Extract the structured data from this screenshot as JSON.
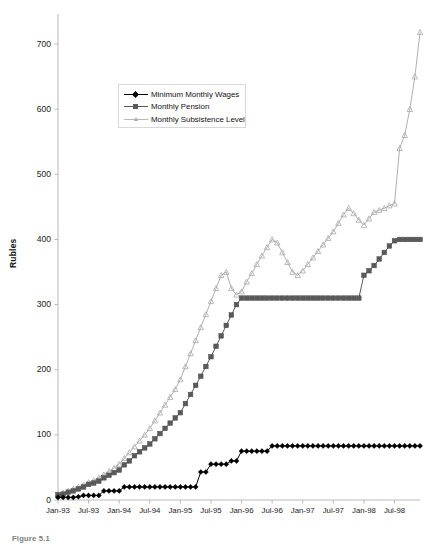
{
  "figure": {
    "caption": "Figure 5.1",
    "ylabel": "Rubles",
    "xlabel": ""
  },
  "legend": {
    "position": "inside-top-left",
    "items": [
      {
        "label": "Minimum Monthly Wages",
        "color": "#000000",
        "marker": "diamond"
      },
      {
        "label": "Monthly Pension",
        "color": "#5a5a5a",
        "marker": "square"
      },
      {
        "label": "Monthly Subsistence Level",
        "color": "#a8a8a8",
        "marker": "triangle"
      }
    ]
  },
  "chart_data": {
    "type": "line",
    "title": "",
    "xlabel": "",
    "ylabel": "Rubles",
    "ylim": [
      0,
      740
    ],
    "yticks": [
      0,
      100,
      200,
      300,
      400,
      500,
      600,
      700
    ],
    "ytick_labels": [
      "0",
      "100",
      "200",
      "300",
      "400",
      "500",
      "600",
      "700"
    ],
    "grid": false,
    "xticks": [
      "Jan-93",
      "Jul-93",
      "Jan-94",
      "Jul-94",
      "Jan-95",
      "Jul-95",
      "Jan-96",
      "Jul-96",
      "Jan-97",
      "Jul-97",
      "Jan-98",
      "Jul-98"
    ],
    "x": [
      "Jan-93",
      "Feb-93",
      "Mar-93",
      "Apr-93",
      "May-93",
      "Jun-93",
      "Jul-93",
      "Aug-93",
      "Sep-93",
      "Oct-93",
      "Nov-93",
      "Dec-93",
      "Jan-94",
      "Feb-94",
      "Mar-94",
      "Apr-94",
      "May-94",
      "Jun-94",
      "Jul-94",
      "Aug-94",
      "Sep-94",
      "Oct-94",
      "Nov-94",
      "Dec-94",
      "Jan-95",
      "Feb-95",
      "Mar-95",
      "Apr-95",
      "May-95",
      "Jun-95",
      "Jul-95",
      "Aug-95",
      "Sep-95",
      "Oct-95",
      "Nov-95",
      "Dec-95",
      "Jan-96",
      "Feb-96",
      "Mar-96",
      "Apr-96",
      "May-96",
      "Jun-96",
      "Jul-96",
      "Aug-96",
      "Sep-96",
      "Oct-96",
      "Nov-96",
      "Dec-96",
      "Jan-97",
      "Feb-97",
      "Mar-97",
      "Apr-97",
      "May-97",
      "Jun-97",
      "Jul-97",
      "Aug-97",
      "Sep-97",
      "Oct-97",
      "Nov-97",
      "Dec-97",
      "Jan-98",
      "Feb-98",
      "Mar-98",
      "Apr-98",
      "May-98",
      "Jun-98",
      "Jul-98",
      "Aug-98",
      "Sep-98",
      "Oct-98",
      "Nov-98",
      "Dec-98"
    ],
    "series": [
      {
        "name": "Minimum Monthly Wages",
        "color": "#000000",
        "marker": "diamond",
        "values": [
          4,
          4,
          4,
          4,
          5,
          7,
          7,
          7,
          7,
          14,
          14,
          14,
          14,
          20,
          20,
          20,
          20,
          20,
          20,
          20,
          20,
          20,
          20,
          20,
          20,
          20,
          20,
          20,
          43,
          43,
          55,
          55,
          55,
          55,
          60,
          60,
          75,
          75,
          75,
          75,
          75,
          75,
          83,
          83,
          83,
          83,
          83,
          83,
          83,
          83,
          83,
          83,
          83,
          83,
          83,
          83,
          83,
          83,
          83,
          83,
          83,
          83,
          83,
          83,
          83,
          83,
          83,
          83,
          83,
          83,
          83,
          83
        ]
      },
      {
        "name": "Monthly Pension",
        "color": "#5a5a5a",
        "marker": "square",
        "values": [
          8,
          9,
          12,
          14,
          17,
          20,
          24,
          26,
          29,
          34,
          38,
          42,
          46,
          54,
          60,
          68,
          74,
          80,
          86,
          94,
          102,
          110,
          118,
          126,
          134,
          148,
          162,
          176,
          190,
          205,
          220,
          236,
          252,
          268,
          284,
          300,
          310,
          310,
          310,
          310,
          310,
          310,
          310,
          310,
          310,
          310,
          310,
          310,
          310,
          310,
          310,
          310,
          310,
          310,
          310,
          310,
          310,
          310,
          310,
          310,
          345,
          352,
          360,
          370,
          380,
          390,
          398,
          400,
          400,
          400,
          400,
          400
        ]
      },
      {
        "name": "Monthly Subsistence Level",
        "color": "#a8a8a8",
        "marker": "triangle",
        "values": [
          9,
          11,
          14,
          17,
          20,
          23,
          27,
          30,
          34,
          39,
          44,
          49,
          55,
          64,
          73,
          82,
          91,
          100,
          110,
          122,
          134,
          146,
          158,
          170,
          185,
          205,
          225,
          245,
          265,
          285,
          305,
          325,
          345,
          350,
          325,
          315,
          320,
          335,
          348,
          362,
          375,
          388,
          400,
          395,
          380,
          365,
          350,
          345,
          352,
          362,
          372,
          382,
          392,
          402,
          412,
          425,
          438,
          448,
          440,
          430,
          422,
          432,
          442,
          445,
          448,
          452,
          455,
          540,
          560,
          600,
          650,
          718
        ]
      }
    ]
  }
}
